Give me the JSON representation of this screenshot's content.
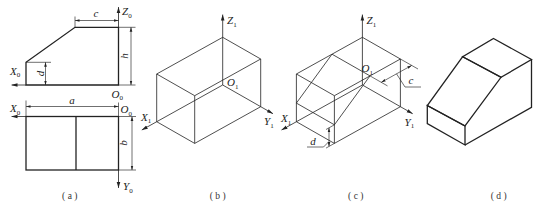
{
  "colors": {
    "line": "#222222",
    "background": "#ffffff",
    "text": "#222222"
  },
  "figure_a": {
    "caption": "(a)",
    "front_view": {
      "axis_x": {
        "main": "X",
        "sub": "0"
      },
      "axis_z": {
        "main": "Z",
        "sub": "0"
      },
      "origin": {
        "main": "O",
        "sub": "0"
      },
      "dim_c": "c",
      "dim_h": "h",
      "dim_d": "d"
    },
    "top_view": {
      "axis_x": {
        "main": "X",
        "sub": "0"
      },
      "axis_y": {
        "main": "Y",
        "sub": "0"
      },
      "origin": {
        "main": "O",
        "sub": "0"
      },
      "dim_a": "a",
      "dim_b": "b"
    }
  },
  "figure_b": {
    "caption": "(b)",
    "axis_x": {
      "main": "X",
      "sub": "1"
    },
    "axis_y": {
      "main": "Y",
      "sub": "1"
    },
    "axis_z": {
      "main": "Z",
      "sub": "1"
    },
    "origin": {
      "main": "O",
      "sub": "1"
    }
  },
  "figure_c": {
    "caption": "(c)",
    "axis_x": {
      "main": "X",
      "sub": "1"
    },
    "axis_y": {
      "main": "Y",
      "sub": "1"
    },
    "axis_z": {
      "main": "Z",
      "sub": "1"
    },
    "origin": {
      "main": "O",
      "sub": "1"
    },
    "dim_c": "c",
    "dim_d": "d"
  },
  "figure_d": {
    "caption": "(d)"
  }
}
